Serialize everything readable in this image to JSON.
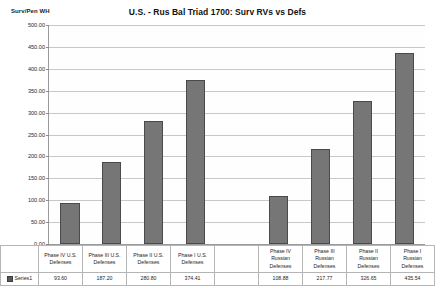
{
  "chart_data": {
    "type": "bar",
    "title": "U.S. - Rus Bal Triad 1700: Surv RVs vs Defs",
    "xlabel": "",
    "ylabel": "Surv/Pen WH",
    "ylim": [
      0,
      500
    ],
    "ytick_step": 50,
    "ytick_labels": [
      "500.00",
      "450.00",
      "400.00",
      "350.00",
      "300.00",
      "250.00",
      "200.00",
      "150.00",
      "100.00",
      "50.00",
      "0.00"
    ],
    "grid": true,
    "legend_position": "data-table",
    "series_name": "Series1",
    "bar_color": "#767676",
    "bar_border_color": "#4a4a4a",
    "categories": [
      "Phase IV U.S. Defenses",
      "Phase III U.S. Defenses",
      "Phase II U.S. Defenses",
      "Phase I U.S. Defenses",
      "",
      "Phase IV Russian Defenses",
      "Phase III Russian Defenses",
      "Phase II Russian Defenses",
      "Phase I Russian Defenses"
    ],
    "category_lines": [
      [
        "Phase IV U.S.",
        "Defenses"
      ],
      [
        "Phase III U.S.",
        "Defenses"
      ],
      [
        "Phase II U.S.",
        "Defenses"
      ],
      [
        "Phase I U.S.",
        "Defenses"
      ],
      [
        ""
      ],
      [
        "Phase IV",
        "Russian",
        "Defenses"
      ],
      [
        "Phase III",
        "Russian",
        "Defenses"
      ],
      [
        "Phase II",
        "Russian",
        "Defenses"
      ],
      [
        "Phase I",
        "Russian",
        "Defenses"
      ]
    ],
    "values": [
      93.6,
      187.2,
      280.8,
      374.41,
      null,
      108.88,
      217.77,
      326.65,
      435.54
    ],
    "value_labels": [
      "93.60",
      "187.20",
      "280.80",
      "374.41",
      "",
      "108.88",
      "217.77",
      "326.65",
      "435.54"
    ]
  }
}
